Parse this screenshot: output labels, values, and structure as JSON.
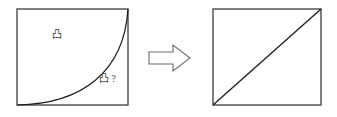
{
  "figure": {
    "title": "",
    "background_color": "#ffffff",
    "line_color": "#1c1c1c",
    "frame_color": "#4a4a4a",
    "arrow_color": "#6a6a6a",
    "left_panel": {
      "name": "curved-boundary-square",
      "frame": {
        "x": 17,
        "y": 9,
        "width": 111,
        "height": 96
      },
      "curve": {
        "description": "concave-up curve from bottom-left corner to top-right corner",
        "start": [
          17,
          105
        ],
        "end": [
          128,
          9
        ],
        "control_1": [
          82,
          104
        ],
        "control_2": [
          124,
          72
        ]
      },
      "labels": [
        {
          "id": "upper-region-label",
          "text": "凸",
          "x": 52,
          "y": 35
        },
        {
          "id": "lower-region-label",
          "text": "凸 ?",
          "x": 99,
          "y": 80
        }
      ]
    },
    "arrow": {
      "name": "transformation-arrow",
      "direction": "right",
      "points": "149,52 173,52 173,45 190,58 173,71 173,64 149,64"
    },
    "right_panel": {
      "name": "diagonal-square",
      "frame": {
        "x": 213,
        "y": 9,
        "width": 108,
        "height": 96
      },
      "diagonal": {
        "description": "straight line from bottom-left corner to top-right corner",
        "start": [
          213,
          105
        ],
        "end": [
          321,
          9
        ]
      }
    }
  }
}
